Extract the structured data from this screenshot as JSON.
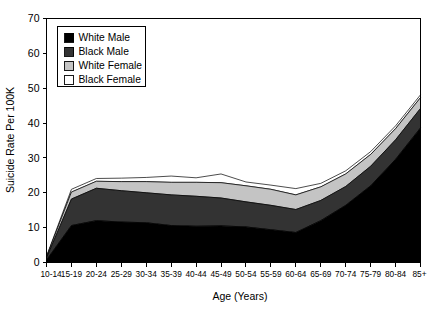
{
  "chart_data": {
    "type": "area",
    "stacked": true,
    "title": "",
    "xlabel": "Age (Years)",
    "ylabel": "Suicide Rate Per 100K",
    "categories": [
      "10-14",
      "15-19",
      "20-24",
      "25-29",
      "30-34",
      "35-39",
      "40-44",
      "45-49",
      "50-54",
      "55-59",
      "60-64",
      "65-69",
      "70-74",
      "75-79",
      "80-84",
      "85+"
    ],
    "ylim": [
      0,
      70
    ],
    "yticks": [
      0,
      10,
      20,
      30,
      40,
      50,
      60,
      70
    ],
    "grid": false,
    "legend_position": "top-left",
    "series": [
      {
        "name": "White Male",
        "color": "#000000",
        "values": [
          0.7,
          10.6,
          12.0,
          11.6,
          11.4,
          10.6,
          10.4,
          10.5,
          10.2,
          9.4,
          8.6,
          12.0,
          16.4,
          22.0,
          29.6,
          38.6
        ]
      },
      {
        "name": "Black Male",
        "color": "#333333",
        "values": [
          0.6,
          7.6,
          9.3,
          9.0,
          8.6,
          8.8,
          8.6,
          8.0,
          7.2,
          7.0,
          6.6,
          5.8,
          5.4,
          5.6,
          5.6,
          5.6
        ]
      },
      {
        "name": "White Female",
        "color": "#c4c4c4",
        "values": [
          0.3,
          2.0,
          2.0,
          2.6,
          3.2,
          3.6,
          4.0,
          4.4,
          4.6,
          4.6,
          4.2,
          3.9,
          3.6,
          3.4,
          3.2,
          3.1
        ]
      },
      {
        "name": "Black Female",
        "color": "#ffffff",
        "values": [
          0.2,
          0.8,
          0.8,
          1.0,
          1.2,
          1.8,
          1.3,
          2.5,
          1.1,
          1.2,
          1.8,
          1.0,
          0.9,
          0.8,
          0.8,
          0.8
        ]
      }
    ]
  },
  "legend": {
    "entries": [
      {
        "label": "White Male",
        "color": "#000000"
      },
      {
        "label": "Black Male",
        "color": "#333333"
      },
      {
        "label": "White Female",
        "color": "#c4c4c4"
      },
      {
        "label": "Black Female",
        "color": "#ffffff"
      }
    ]
  }
}
